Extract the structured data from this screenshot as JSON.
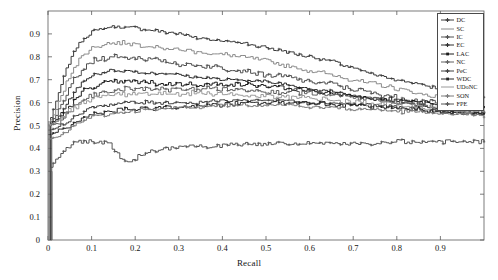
{
  "chart_data": {
    "type": "line",
    "title": "",
    "xlabel": "Recall",
    "ylabel": "Precision",
    "xlim": [
      0,
      1.0
    ],
    "ylim": [
      0,
      1.0
    ],
    "grid": false,
    "legend_position": "top-right",
    "xticks": [
      "0",
      "0.1",
      "0.2",
      "0.3",
      "0.4",
      "0.5",
      "0.6",
      "0.7",
      "0.8",
      "0.9"
    ],
    "xtick_values": [
      0,
      0.1,
      0.2,
      0.3,
      0.4,
      0.5,
      0.6,
      0.7,
      0.8,
      0.9
    ],
    "yticks": [
      "0",
      "0.1",
      "0.2",
      "0.3",
      "0.4",
      "0.5",
      "0.6",
      "0.7",
      "0.8",
      "0.9"
    ],
    "ytick_values": [
      0,
      0.1,
      0.2,
      0.3,
      0.4,
      0.5,
      0.6,
      0.7,
      0.8,
      0.9
    ],
    "x": [
      0.0,
      0.02,
      0.04,
      0.06,
      0.08,
      0.1,
      0.14,
      0.18,
      0.22,
      0.26,
      0.3,
      0.35,
      0.4,
      0.45,
      0.5,
      0.55,
      0.6,
      0.65,
      0.7,
      0.75,
      0.8,
      0.85,
      0.9,
      0.95,
      1.0
    ],
    "series": [
      {
        "name": "DC",
        "color": "#3c3c3c",
        "marker": "cross",
        "values": [
          0.5,
          0.62,
          0.74,
          0.83,
          0.88,
          0.91,
          0.93,
          0.93,
          0.92,
          0.91,
          0.9,
          0.88,
          0.87,
          0.86,
          0.84,
          0.82,
          0.8,
          0.78,
          0.75,
          0.72,
          0.7,
          0.68,
          0.66,
          0.64,
          0.62
        ]
      },
      {
        "name": "SC",
        "color": "#8a8a8a",
        "marker": "none",
        "values": [
          0.5,
          0.58,
          0.68,
          0.76,
          0.81,
          0.84,
          0.86,
          0.86,
          0.85,
          0.84,
          0.83,
          0.82,
          0.81,
          0.8,
          0.78,
          0.76,
          0.74,
          0.72,
          0.7,
          0.68,
          0.66,
          0.64,
          0.62,
          0.6,
          0.58
        ]
      },
      {
        "name": "IC",
        "color": "#505050",
        "marker": "cross",
        "values": [
          0.5,
          0.55,
          0.63,
          0.7,
          0.75,
          0.78,
          0.8,
          0.8,
          0.79,
          0.78,
          0.77,
          0.76,
          0.75,
          0.74,
          0.72,
          0.71,
          0.69,
          0.68,
          0.66,
          0.64,
          0.62,
          0.61,
          0.59,
          0.58,
          0.56
        ]
      },
      {
        "name": "EC",
        "color": "#2e2e2e",
        "marker": "cross",
        "values": [
          0.5,
          0.53,
          0.59,
          0.65,
          0.69,
          0.72,
          0.74,
          0.74,
          0.73,
          0.73,
          0.72,
          0.71,
          0.7,
          0.7,
          0.69,
          0.68,
          0.66,
          0.65,
          0.63,
          0.62,
          0.6,
          0.59,
          0.57,
          0.56,
          0.55
        ]
      },
      {
        "name": "LAC",
        "color": "#1c1c1c",
        "marker": "square",
        "values": [
          0.5,
          0.52,
          0.56,
          0.61,
          0.65,
          0.67,
          0.69,
          0.69,
          0.69,
          0.68,
          0.68,
          0.68,
          0.68,
          0.68,
          0.67,
          0.66,
          0.65,
          0.64,
          0.63,
          0.62,
          0.61,
          0.6,
          0.59,
          0.58,
          0.57
        ]
      },
      {
        "name": "NC",
        "color": "#606060",
        "marker": "cross",
        "values": [
          0.5,
          0.51,
          0.54,
          0.58,
          0.61,
          0.63,
          0.65,
          0.66,
          0.66,
          0.66,
          0.66,
          0.66,
          0.66,
          0.66,
          0.65,
          0.65,
          0.64,
          0.63,
          0.62,
          0.61,
          0.6,
          0.59,
          0.58,
          0.57,
          0.56
        ]
      },
      {
        "name": "PeC",
        "color": "#404040",
        "marker": "cross",
        "values": [
          0.48,
          0.49,
          0.51,
          0.54,
          0.56,
          0.58,
          0.59,
          0.6,
          0.6,
          0.6,
          0.6,
          0.6,
          0.61,
          0.61,
          0.61,
          0.61,
          0.6,
          0.6,
          0.59,
          0.59,
          0.58,
          0.57,
          0.56,
          0.56,
          0.55
        ]
      },
      {
        "name": "WDC",
        "color": "#262626",
        "marker": "square",
        "values": [
          0.46,
          0.47,
          0.49,
          0.51,
          0.53,
          0.55,
          0.56,
          0.57,
          0.57,
          0.58,
          0.58,
          0.59,
          0.59,
          0.6,
          0.6,
          0.6,
          0.6,
          0.59,
          0.59,
          0.58,
          0.57,
          0.57,
          0.56,
          0.55,
          0.55
        ]
      },
      {
        "name": "UDoNC",
        "color": "#9a9a9a",
        "marker": "none",
        "values": [
          0.5,
          0.52,
          0.55,
          0.58,
          0.6,
          0.62,
          0.63,
          0.64,
          0.64,
          0.64,
          0.64,
          0.64,
          0.64,
          0.63,
          0.63,
          0.62,
          0.62,
          0.61,
          0.6,
          0.6,
          0.59,
          0.58,
          0.57,
          0.57,
          0.56
        ]
      },
      {
        "name": "SON",
        "color": "#7a7a7a",
        "marker": "cross",
        "values": [
          0.44,
          0.45,
          0.47,
          0.5,
          0.52,
          0.54,
          0.55,
          0.56,
          0.57,
          0.57,
          0.58,
          0.58,
          0.59,
          0.59,
          0.59,
          0.59,
          0.58,
          0.58,
          0.57,
          0.57,
          0.56,
          0.56,
          0.55,
          0.55,
          0.54
        ]
      },
      {
        "name": "FPE",
        "color": "#555555",
        "marker": "cross",
        "values": [
          0.3,
          0.36,
          0.4,
          0.42,
          0.43,
          0.43,
          0.42,
          0.33,
          0.38,
          0.4,
          0.41,
          0.41,
          0.41,
          0.42,
          0.42,
          0.42,
          0.42,
          0.42,
          0.42,
          0.42,
          0.43,
          0.43,
          0.43,
          0.43,
          0.43
        ]
      }
    ]
  },
  "axes": {
    "xlabel": "Recall",
    "ylabel": "Precision"
  }
}
